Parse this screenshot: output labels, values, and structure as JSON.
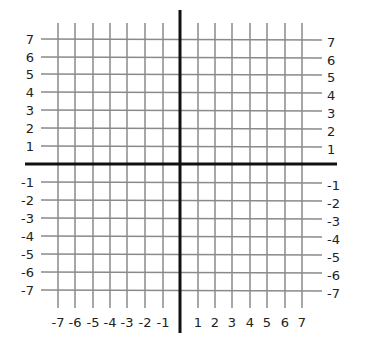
{
  "diagram": {
    "type": "coordinate-plane",
    "title": "",
    "grid": {
      "x_min": -7,
      "x_max": 7,
      "y_min": -7,
      "y_max": 7,
      "step": 1,
      "line_color": "#8a8a8a",
      "axis_color": "#111111"
    },
    "x_axis_labels": [
      "-7",
      "-6",
      "-5",
      "-4",
      "-3",
      "-2",
      "-1",
      "1",
      "2",
      "3",
      "4",
      "5",
      "6",
      "7"
    ],
    "y_axis_labels_left": [
      "7",
      "6",
      "5",
      "4",
      "3",
      "2",
      "1",
      "-1",
      "-2",
      "-3",
      "-4",
      "-5",
      "-6",
      "-7"
    ],
    "y_axis_labels_right": [
      "7",
      "6",
      "5",
      "4",
      "3",
      "2",
      "1",
      "-1",
      "-2",
      "-3",
      "-4",
      "-5",
      "-6",
      "-7"
    ]
  }
}
